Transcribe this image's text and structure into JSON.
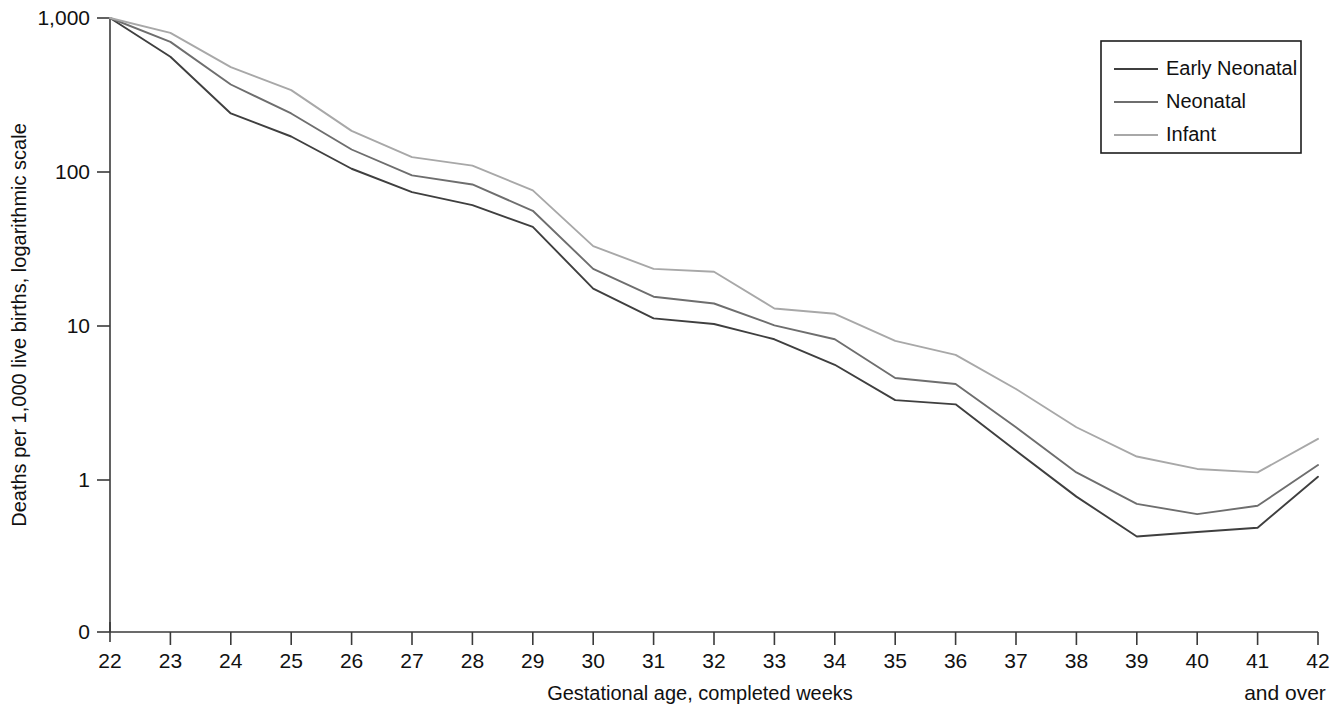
{
  "chart_data": {
    "type": "line",
    "title": "",
    "xlabel": "Gestational age, completed weeks",
    "ylabel": "Deaths per 1,000 live births, logarithmic scale",
    "x_overflow_note": "and over",
    "y_scale": "log",
    "y_tick_labels": [
      "1,000",
      "100",
      "10",
      "1",
      "0"
    ],
    "y_tick_values": [
      1000,
      100,
      10,
      1,
      0
    ],
    "grid": false,
    "legend_position": "top-right",
    "categories": [
      22,
      23,
      24,
      25,
      26,
      27,
      28,
      29,
      30,
      31,
      32,
      33,
      34,
      35,
      36,
      37,
      38,
      39,
      40,
      41,
      42
    ],
    "x_tick_labels": [
      "22",
      "23",
      "24",
      "25",
      "26",
      "27",
      "28",
      "29",
      "30",
      "31",
      "32",
      "33",
      "34",
      "35",
      "36",
      "37",
      "38",
      "39",
      "40",
      "41",
      "42"
    ],
    "series": [
      {
        "name": "Early Neonatal",
        "color": "#3f3f3f",
        "values": [
          1000,
          560,
          240,
          170,
          105,
          74,
          61,
          44,
          17.5,
          11.2,
          10.3,
          8.2,
          5.6,
          3.3,
          3.1,
          1.55,
          0.78,
          0.43,
          0.46,
          0.49,
          1.05
        ]
      },
      {
        "name": "Neonatal",
        "color": "#6e6e6e",
        "values": [
          1000,
          700,
          370,
          240,
          140,
          95,
          83,
          56,
          23.5,
          15.5,
          14.0,
          10.1,
          8.2,
          4.6,
          4.2,
          2.2,
          1.12,
          0.7,
          0.6,
          0.68,
          1.25
        ]
      },
      {
        "name": "Infant",
        "color": "#a8a8a8",
        "values": [
          1000,
          800,
          480,
          340,
          185,
          125,
          110,
          76,
          33,
          23.5,
          22.5,
          13.0,
          12.0,
          8.0,
          6.5,
          3.9,
          2.2,
          1.42,
          1.18,
          1.12,
          1.85
        ]
      }
    ]
  }
}
